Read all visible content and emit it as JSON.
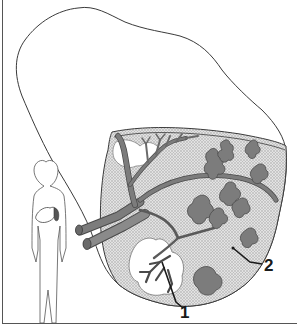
{
  "figure": {
    "labels": [
      {
        "id": "1",
        "text": "1"
      },
      {
        "id": "2",
        "text": "2"
      }
    ],
    "inset": "human-silhouette-with-liver-location",
    "colors": {
      "outline": "#3a3a3a",
      "vessel_fill": "#7c7c7c",
      "vessel_stroke": "#4a4a4a",
      "tissue_fill": "#d8d8d8",
      "background": "#ffffff"
    }
  }
}
